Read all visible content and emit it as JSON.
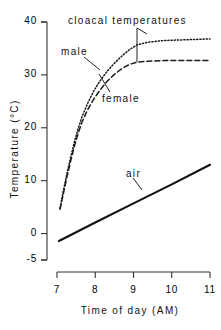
{
  "chart_data": {
    "type": "line",
    "title": "cloacal temperatures",
    "xlabel": "Time of day (AM)",
    "ylabel": "Temperature (°C)",
    "xlim": [
      7,
      11
    ],
    "ylim": [
      -5,
      40
    ],
    "grid": false,
    "legend": "inline-annotations",
    "xticks": [
      7,
      8,
      9,
      10,
      11
    ],
    "xtick_labels": [
      "7",
      "8",
      "9",
      "10",
      "11"
    ],
    "yticks": [
      -5,
      0,
      10,
      20,
      30,
      40
    ],
    "ytick_labels": [
      "-5",
      "0",
      "10",
      "20",
      "30",
      "40"
    ],
    "annotations": [
      {
        "text": "cloacal temperatures",
        "x": 9.1,
        "y": 39.2,
        "leader": true
      },
      {
        "text": "male",
        "x": 7.15,
        "y": 34.0,
        "leader": true
      },
      {
        "text": "female",
        "x": 8.25,
        "y": 25.5,
        "leader": true
      },
      {
        "text": "air",
        "x": 8.85,
        "y": 11.5,
        "leader": true
      }
    ],
    "series": [
      {
        "name": "male",
        "style": "dotted",
        "color": "#1a1a1a",
        "x": [
          7.08,
          7.15,
          7.25,
          7.35,
          7.45,
          7.55,
          7.65,
          7.8,
          7.95,
          8.1,
          8.3,
          8.5,
          8.7,
          8.9,
          9.1,
          9.4,
          9.8,
          10.2,
          10.6,
          11.0
        ],
        "y": [
          4.8,
          7.5,
          11.0,
          14.2,
          17.2,
          19.8,
          22.0,
          24.6,
          26.8,
          28.6,
          30.6,
          32.2,
          33.6,
          34.8,
          35.7,
          36.2,
          36.5,
          36.6,
          36.7,
          36.8
        ]
      },
      {
        "name": "female",
        "style": "dashed",
        "color": "#1a1a1a",
        "x": [
          7.08,
          7.15,
          7.25,
          7.35,
          7.45,
          7.55,
          7.65,
          7.8,
          7.95,
          8.1,
          8.3,
          8.5,
          8.7,
          8.9,
          9.1,
          9.4,
          9.8,
          10.2,
          10.6,
          11.0
        ],
        "y": [
          4.6,
          7.0,
          10.4,
          13.5,
          16.4,
          18.9,
          21.0,
          23.4,
          25.3,
          26.9,
          28.7,
          30.1,
          31.2,
          32.0,
          32.4,
          32.6,
          32.7,
          32.7,
          32.7,
          32.7
        ]
      },
      {
        "name": "air",
        "style": "solid",
        "color": "#111111",
        "x": [
          7.05,
          8.0,
          9.0,
          10.0,
          11.0
        ],
        "y": [
          -1.4,
          2.1,
          5.7,
          9.3,
          13.0
        ]
      }
    ]
  },
  "axes": {
    "y_title": "Temperature (°C)",
    "x_title": "Time of day (AM)"
  },
  "labels": {
    "cloacal": "cloacal temperatures",
    "male": "male",
    "female": "female",
    "air": "air"
  }
}
